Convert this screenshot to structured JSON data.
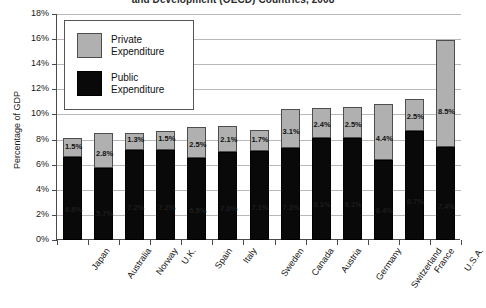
{
  "title": "and Development (OECD) Countries, 2008",
  "axis": {
    "ylabel": "Percentage of GDP",
    "yticks": [
      "0%",
      "2%",
      "4%",
      "6%",
      "8%",
      "10%",
      "12%",
      "14%",
      "16%",
      "18%"
    ]
  },
  "legend": {
    "private_label_line1": "Private",
    "private_label_line2": "Expenditure",
    "public_label_line1": "Public",
    "public_label_line2": "Expenditure",
    "private_color": "#b0b0b0",
    "public_color": "#090909"
  },
  "chart_data": {
    "type": "bar",
    "title": "and Development (OECD) Countries, 2008",
    "xlabel": "",
    "ylabel": "Percentage of GDP",
    "ylim": [
      0,
      18
    ],
    "ytick_step": 2,
    "grid": true,
    "stacked": true,
    "legend_position": "top-left-inside",
    "categories": [
      "Japan",
      "Australia",
      "Norway",
      "U.K.",
      "Spain",
      "Italy",
      "Sweden",
      "Canada",
      "Austria",
      "Germany",
      "Switzerland",
      "France",
      "U.S.A."
    ],
    "series": [
      {
        "name": "Public Expenditure",
        "color": "#090909",
        "values": [
          6.6,
          5.7,
          7.2,
          7.2,
          6.5,
          7.0,
          7.1,
          7.3,
          8.1,
          8.1,
          6.4,
          8.7,
          7.4
        ],
        "labels": [
          "6.6%",
          "5.7%",
          "7.2%",
          "7.2%",
          "6.5%",
          "7.0%",
          "7.1%",
          "7.3%",
          "8.1%",
          "8.1%",
          "6.4%",
          "8.7%",
          "7.4%"
        ]
      },
      {
        "name": "Private Expenditure",
        "color": "#b0b0b0",
        "values": [
          1.5,
          2.8,
          1.3,
          1.5,
          2.5,
          2.1,
          1.7,
          3.1,
          2.4,
          2.5,
          4.4,
          2.5,
          8.5
        ],
        "labels": [
          "1.5%",
          "2.8%",
          "1.3%",
          "1.5%",
          "2.5%",
          "2.1%",
          "1.7%",
          "3.1%",
          "2.4%",
          "2.5%",
          "4.4%",
          "2.5%",
          "8.5%"
        ]
      }
    ],
    "totals": [
      8.1,
      8.5,
      8.5,
      8.7,
      9.0,
      9.1,
      8.8,
      10.4,
      10.5,
      10.6,
      10.8,
      11.2,
      15.9
    ]
  }
}
